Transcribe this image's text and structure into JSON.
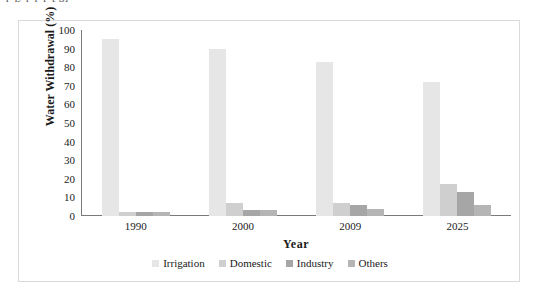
{
  "caption": {
    "truncated_text": "pqy p p p [ g]"
  },
  "chart_data": {
    "type": "bar",
    "title": "",
    "xlabel": "Year",
    "ylabel": "Water Withdrawal (%)",
    "categories": [
      "1990",
      "2000",
      "2009",
      "2025"
    ],
    "ylim": [
      0,
      100
    ],
    "yticks": [
      100,
      90,
      80,
      70,
      60,
      50,
      40,
      30,
      20,
      10,
      0
    ],
    "grid": false,
    "legend_position": "bottom",
    "series": [
      {
        "name": "Irrigation",
        "color": "#e6e6e6",
        "values": [
          95,
          90,
          83,
          72
        ]
      },
      {
        "name": "Domestic",
        "color": "#cfcfcf",
        "values": [
          2,
          7,
          7,
          17
        ]
      },
      {
        "name": "Industry",
        "color": "#a6a6a6",
        "values": [
          2,
          3,
          6,
          13
        ]
      },
      {
        "name": "Others",
        "color": "#b5b5b5",
        "values": [
          2,
          3,
          4,
          6
        ]
      }
    ]
  }
}
